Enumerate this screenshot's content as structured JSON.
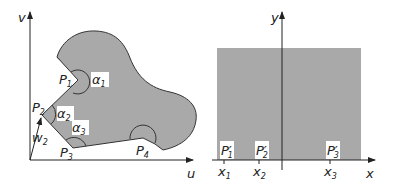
{
  "left_panel": {
    "axes": {
      "vertical": "v",
      "horizontal": "u"
    },
    "points": [
      {
        "name": "P",
        "sub": "1"
      },
      {
        "name": "P",
        "sub": "2"
      },
      {
        "name": "P",
        "sub": "3"
      },
      {
        "name": "P",
        "sub": "4"
      }
    ],
    "angles": [
      {
        "name": "α",
        "sub": "1"
      },
      {
        "name": "α",
        "sub": "2"
      },
      {
        "name": "α",
        "sub": "3"
      }
    ],
    "vector": {
      "name": "w",
      "sub": "2"
    }
  },
  "right_panel": {
    "axes": {
      "vertical": "y",
      "horizontal": "x"
    },
    "points": [
      {
        "name": "P′",
        "sub": "1"
      },
      {
        "name": "P′",
        "sub": "2"
      },
      {
        "name": "P′",
        "sub": "3"
      }
    ],
    "ticks": [
      {
        "name": "x",
        "sub": "1"
      },
      {
        "name": "x",
        "sub": "2"
      },
      {
        "name": "x",
        "sub": "3"
      }
    ]
  },
  "colors": {
    "fill": "#a8a8a8",
    "stroke": "#333333",
    "background": "#ffffff"
  }
}
